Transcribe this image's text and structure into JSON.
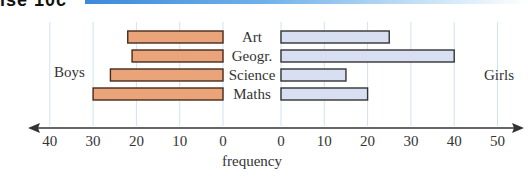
{
  "header": {
    "label": "ise 10c"
  },
  "chart_data": {
    "type": "bar",
    "orientation": "horizontal-back-to-back",
    "title": "",
    "xlabel": "frequency",
    "categories": [
      "Art",
      "Geogr.",
      "Science",
      "Maths"
    ],
    "series": [
      {
        "name": "Boys",
        "side": "left",
        "color": "#e9a47a",
        "values": [
          22,
          21,
          26,
          30
        ]
      },
      {
        "name": "Girls",
        "side": "right",
        "color": "#d8dff2",
        "values": [
          25,
          40,
          15,
          20
        ]
      }
    ],
    "left_axis": {
      "ticks": [
        "40",
        "30",
        "20",
        "10",
        "0"
      ],
      "range": [
        0,
        40
      ]
    },
    "right_axis": {
      "ticks": [
        "0",
        "10",
        "20",
        "30",
        "40",
        "50"
      ],
      "range": [
        0,
        50
      ]
    },
    "side_labels": {
      "left": "Boys",
      "right": "Girls"
    },
    "grid": true,
    "legend": "none"
  }
}
